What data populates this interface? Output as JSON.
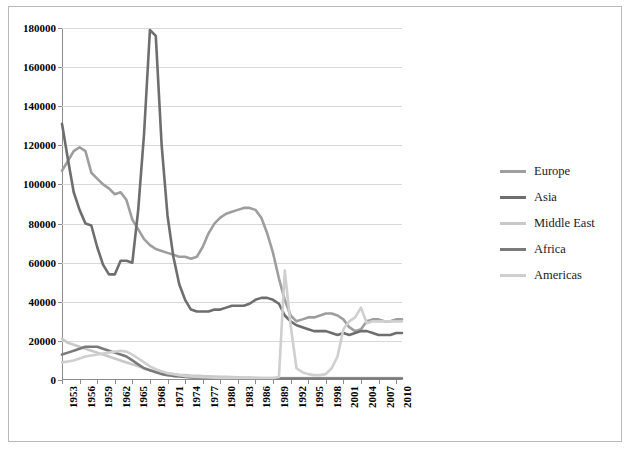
{
  "chart_title": "",
  "chart_data": {
    "type": "line",
    "title": "",
    "subtitle": "",
    "xlabel": "",
    "ylabel": "",
    "grid": true,
    "legend_position": "right",
    "ylim": [
      0,
      180000
    ],
    "yticks": [
      0,
      20000,
      40000,
      60000,
      80000,
      100000,
      120000,
      140000,
      160000,
      180000
    ],
    "ytick_labels": [
      "0",
      "20000",
      "40000",
      "60000",
      "80000",
      "100000",
      "120000",
      "140000",
      "160000",
      "180000"
    ],
    "xlim": [
      1953,
      2011
    ],
    "xticks": [
      1953,
      1956,
      1959,
      1962,
      1965,
      1968,
      1971,
      1974,
      1977,
      1980,
      1983,
      1986,
      1989,
      1992,
      1995,
      1998,
      2001,
      2004,
      2007,
      2010
    ],
    "xtick_labels": [
      "1953",
      "1956",
      "1959",
      "1962",
      "1965",
      "1968",
      "1971",
      "1974",
      "1977",
      "1980",
      "1983",
      "1986",
      "1989",
      "1992",
      "1995",
      "1998",
      "2001",
      "2004",
      "2007",
      "2010"
    ],
    "x": [
      1953,
      1954,
      1955,
      1956,
      1957,
      1958,
      1959,
      1960,
      1961,
      1962,
      1963,
      1964,
      1965,
      1966,
      1967,
      1968,
      1969,
      1970,
      1971,
      1972,
      1973,
      1974,
      1975,
      1976,
      1977,
      1978,
      1979,
      1980,
      1981,
      1982,
      1983,
      1984,
      1985,
      1986,
      1987,
      1988,
      1989,
      1990,
      1991,
      1992,
      1993,
      1994,
      1995,
      1996,
      1997,
      1998,
      1999,
      2000,
      2001,
      2002,
      2003,
      2004,
      2005,
      2006,
      2007,
      2008,
      2009,
      2010,
      2011
    ],
    "series": [
      {
        "name": "Europe",
        "color": "#9e9e9e",
        "values": [
          107000,
          112000,
          117000,
          119000,
          117000,
          106000,
          103000,
          100000,
          98000,
          95000,
          96000,
          92000,
          82000,
          77000,
          72000,
          69000,
          67000,
          66000,
          65000,
          64000,
          63000,
          63000,
          62000,
          63000,
          68000,
          75000,
          80000,
          83000,
          85000,
          86000,
          87000,
          88000,
          88000,
          87000,
          83000,
          75000,
          65000,
          52000,
          41000,
          33000,
          30000,
          31000,
          32000,
          32000,
          33000,
          34000,
          34000,
          33000,
          31000,
          27000,
          25000,
          26000,
          30000,
          31000,
          31000,
          30000,
          30000,
          31000,
          31000
        ]
      },
      {
        "name": "Asia",
        "color": "#6e6e6e",
        "values": [
          131000,
          113000,
          96000,
          87000,
          80000,
          79000,
          68000,
          59000,
          54000,
          54000,
          61000,
          61000,
          60000,
          87000,
          126000,
          179000,
          176000,
          120000,
          84000,
          63000,
          49000,
          41000,
          36000,
          35000,
          35000,
          35000,
          36000,
          36000,
          37000,
          38000,
          38000,
          38000,
          39000,
          41000,
          42000,
          42000,
          41000,
          39000,
          33000,
          30000,
          28000,
          27000,
          26000,
          25000,
          25000,
          25000,
          24000,
          23000,
          24000,
          23000,
          24000,
          25000,
          25000,
          24000,
          23000,
          23000,
          23000,
          24000,
          24000
        ]
      },
      {
        "name": "Middle East",
        "color": "#c8c8c8",
        "values": [
          21000,
          19000,
          18000,
          17000,
          16000,
          15000,
          14000,
          13000,
          12000,
          11000,
          10000,
          9000,
          8000,
          7000,
          6000,
          5000,
          4500,
          4000,
          3500,
          3000,
          2700,
          2500,
          2300,
          2200,
          2000,
          1900,
          1800,
          1700,
          1600,
          1500,
          1400,
          1300,
          1200,
          1100,
          1000,
          1000,
          1000,
          1000,
          1000,
          1000,
          1000,
          1000,
          1000,
          1000,
          1000,
          1000,
          1000,
          1000,
          1000,
          1000,
          1000,
          1000,
          1000,
          1000,
          1000,
          1000,
          1000,
          1000,
          1000
        ]
      },
      {
        "name": "Africa",
        "color": "#7a7a7a",
        "values": [
          13000,
          14000,
          15000,
          16000,
          17000,
          17000,
          17000,
          16000,
          15000,
          14000,
          13000,
          12000,
          10000,
          8000,
          6000,
          5000,
          4000,
          3000,
          2500,
          2000,
          1800,
          1500,
          1300,
          1200,
          1100,
          1000,
          1000,
          900,
          900,
          800,
          800,
          800,
          800,
          800,
          800,
          800,
          800,
          800,
          800,
          800,
          800,
          800,
          800,
          800,
          800,
          800,
          800,
          800,
          800,
          800,
          800,
          800,
          800,
          800,
          800,
          800,
          800,
          800,
          800
        ]
      },
      {
        "name": "Americas",
        "color": "#cfcfcf",
        "values": [
          9000,
          9500,
          10000,
          11000,
          12000,
          12500,
          13000,
          13500,
          14000,
          14500,
          15000,
          14500,
          13000,
          11000,
          9000,
          7000,
          5500,
          4500,
          3500,
          3000,
          2500,
          2000,
          1800,
          1500,
          1400,
          1300,
          1200,
          1100,
          1000,
          1000,
          1000,
          1000,
          1000,
          1000,
          1000,
          1000,
          1000,
          1500,
          56000,
          28000,
          6000,
          4000,
          3000,
          2500,
          2500,
          3000,
          6000,
          12000,
          26000,
          30000,
          32000,
          37000,
          29000,
          30000,
          30000,
          30000,
          30000,
          30000,
          30000
        ]
      }
    ]
  },
  "legend": {
    "items": [
      {
        "label": "Europe",
        "color": "#9e9e9e"
      },
      {
        "label": "Asia",
        "color": "#6e6e6e"
      },
      {
        "label": "Middle East",
        "color": "#c8c8c8"
      },
      {
        "label": "Africa",
        "color": "#7a7a7a"
      },
      {
        "label": "Americas",
        "color": "#cfcfcf"
      }
    ]
  }
}
